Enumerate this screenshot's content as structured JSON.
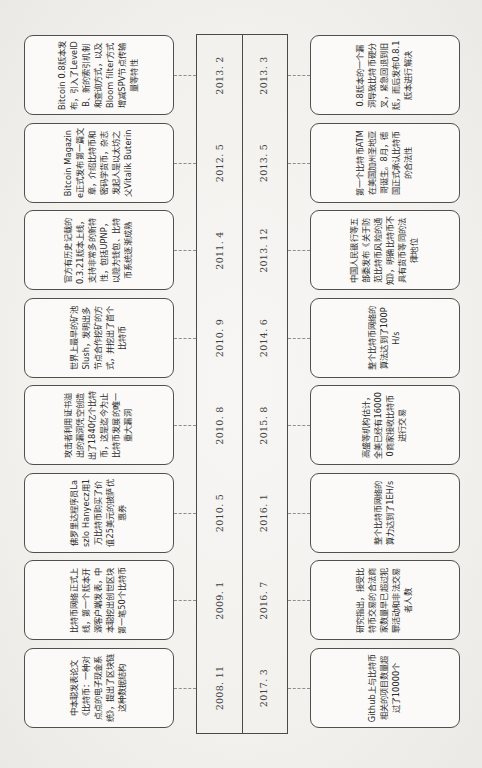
{
  "figure": {
    "caption_number": "图 3-1",
    "caption_title": "区块链 1.0 发展历程",
    "caption_full": "图 3-1  区块链 1.0 发展历程"
  },
  "colors": {
    "paper": "#f3f2f0",
    "card_fill": "#fbfaf8",
    "stroke": "#4f4f4f",
    "leader": "#8e8e8e",
    "text": "#2c2c2c"
  },
  "timeline": {
    "orientation": "rotated-90-ccw",
    "rows": [
      "top",
      "bottom"
    ],
    "events_top": [
      {
        "date": "2008. 11",
        "text": "中本聪发表论文《比特币：一种对点点的电子现金系统》，提出了区块链这种数据结构"
      },
      {
        "date": "2009. 1",
        "text": "比特币网络正式上线，第一个版本开源客户端发表，中本聪挖出创世区块第一笔50个比特币"
      },
      {
        "date": "2010. 5",
        "text": "佛罗里达程序员Laszlo Hanyecz用1万比特币购买了价值25美元的披萨优惠券"
      },
      {
        "date": "2010. 8",
        "text": "攻击者利用证书溢出的漏洞凭空创造出了1840亿个比特币，这是迄今为止比特币发展的唯一重大漏洞"
      },
      {
        "date": "2010. 9",
        "text": "世界上最早的矿池Slush，发明出多节点合作挖矿的方式，并挖出了首个比特币"
      },
      {
        "date": "2011. 4",
        "text": "官方有历史记载的0.3.21版本上线，支持非常多的新特性，包括UPNP，以隐为钱包、比特币系统逐渐成熟"
      },
      {
        "date": "2012. 5",
        "text": "Bitcoin Magazine正式发布第一篇文章，介绍比特币和密码学货币，杂志发起人是以太坊之父Vitalik Buterin"
      },
      {
        "date": "2013. 2",
        "text": "Bitcoin 0.8版本发布，引入了LevelDB、新的索引机制和查询方式，以及Bloom filter方式增减SPV节点传输量等特性"
      }
    ],
    "events_bottom": [
      {
        "date": "2017. 3",
        "text": "Github上与比特币相关的项目数量超过了10000个"
      },
      {
        "date": "2016. 7",
        "text": "研究指出，接受比特币交易的合法商家数量早已超过犯罪活动和非法交易者人数"
      },
      {
        "date": "2016. 1",
        "text": "整个比特币网络的算力达到了1EH/s"
      },
      {
        "date": "2015. 8",
        "text": "高盛等机构估计，全美已经有160000商家接收比特币进行交易"
      },
      {
        "date": "2014. 6",
        "text": "整个比特币网络的算法达到了100PH/s"
      },
      {
        "date": "2013. 12",
        "text": "中国人民银行等五部委发布《关于防范比特币风险的通知》，明确比特币不具有货币等同的法律地位"
      },
      {
        "date": "2013. 5",
        "text": "第一个比特币ATM在美国加州圣地亚哥诞生。8月，德国正式承认比特币的合法性"
      },
      {
        "date": "2013. 3",
        "text": "0.8版本的一个漏洞导致比特币硬分叉，紧急回退到旧版，而后发布0.8.1版本进行解决"
      }
    ]
  }
}
